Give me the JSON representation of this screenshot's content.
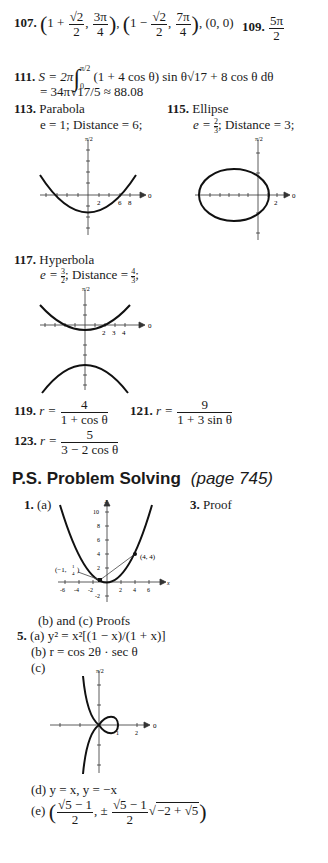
{
  "answers": {
    "a107": {
      "number": "107.",
      "p1_a": "1 +",
      "p1_num": "√2",
      "p1_den": "2",
      "p1_b_num": "3π",
      "p1_b_den": "4",
      "p2_a": "1 −",
      "p2_num": "√2",
      "p2_den": "2",
      "p2_b_num": "7π",
      "p2_b_den": "4",
      "p3": "(0, 0)"
    },
    "a109": {
      "number": "109.",
      "num": "5π",
      "den": "2"
    },
    "a111": {
      "number": "111.",
      "line1_pre": "S = 2π",
      "upper": "π/2",
      "lower": "0",
      "line1_post": "(1 + 4 cos θ) sin θ√17 + 8 cos θ dθ",
      "line2": "= 34π√17/5 ≈ 88.08"
    },
    "a113": {
      "number": "113.",
      "type": "Parabola",
      "detail": "e = 1; Distance = 6;"
    },
    "a115": {
      "number": "115.",
      "type": "Ellipse",
      "detail_pre": "e = ",
      "e_num": "2",
      "e_den": "3",
      "detail_post": "; Distance = 3;"
    },
    "a117": {
      "number": "117.",
      "type": "Hyperbola",
      "detail_pre": "e = ",
      "e_num": "3",
      "e_den": "2",
      "mid": "; Distance = ",
      "d_num": "4",
      "d_den": "3",
      "detail_post": ";"
    },
    "a119": {
      "number": "119.",
      "lhs": "r =",
      "num": "4",
      "den": "1 + cos θ"
    },
    "a121": {
      "number": "121.",
      "lhs": "r =",
      "num": "9",
      "den": "1 + 3 sin θ"
    },
    "a123": {
      "number": "123.",
      "lhs": "r =",
      "num": "5",
      "den": "3 − 2 cos θ"
    }
  },
  "section": {
    "title": "P.S. Problem Solving",
    "page": "(page 745)"
  },
  "ps": {
    "p1": {
      "number": "1.",
      "part_a": "(a)",
      "part_bc": "(b) and (c) Proofs",
      "graph": {
        "y_label": "y",
        "x_label": "x",
        "y_ticks": [
          "10",
          "8",
          "6",
          "4",
          "2",
          "-2"
        ],
        "x_ticks": [
          "-6",
          "-4",
          "-2",
          "2",
          "4",
          "6"
        ],
        "point1": "(4, 4)",
        "point2_pre": "(−1,",
        "point2_num": "1",
        "point2_den": "4",
        "point2_post": ")"
      }
    },
    "p3": {
      "number": "3.",
      "text": "Proof"
    },
    "p5": {
      "number": "5.",
      "a": "(a)  y² = x²[(1 − x)/(1 + x)]",
      "b": "(b)  r = cos 2θ · sec θ",
      "c": "(c)",
      "d": "(d)  y = x, y = −x",
      "e_label": "(e)",
      "e_num": "√5 − 1",
      "e_den": "2",
      "e_pm": ", ±",
      "e_num2": "√5 − 1",
      "e_den2": "2",
      "e_sqrt": "−2 + √5"
    }
  },
  "graph_labels": {
    "half_pi": "π/2",
    "zero": "0",
    "p113_ticks": [
      "2",
      "6",
      "8"
    ],
    "p115_ticks": [
      "2"
    ],
    "p117_ticks": [
      "2",
      "3",
      "4"
    ],
    "p5_ticks": [
      "1",
      "2"
    ]
  }
}
